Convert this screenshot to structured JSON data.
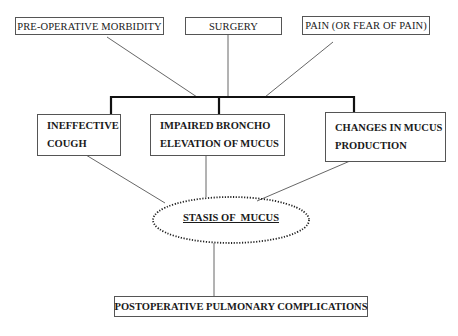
{
  "diagram": {
    "causes": [
      {
        "id": "pre_op",
        "label": "PRE-OPERATIVE MORBIDITY"
      },
      {
        "id": "surgery",
        "label": "SURGERY"
      },
      {
        "id": "pain",
        "label": "PAIN (OR FEAR OF PAIN)"
      }
    ],
    "mechanisms": [
      {
        "id": "cough",
        "lines": [
          "INEFFECTIVE",
          "COUGH"
        ]
      },
      {
        "id": "broncho",
        "lines": [
          "IMPAIRED BRONCHO",
          "ELEVATION OF MUCUS"
        ]
      },
      {
        "id": "mucus_prod",
        "lines": [
          "CHANGES IN MUCUS",
          "PRODUCTION"
        ]
      }
    ],
    "central_node": {
      "label": "STASIS OF  MUCUS",
      "shape": "dotted-ellipse"
    },
    "outcome": {
      "label": "POSTOPERATIVE PULMONARY COMPLICATIONS"
    },
    "edges": [
      {
        "from": "pre_op",
        "to": "bracket"
      },
      {
        "from": "surgery",
        "to": "bracket"
      },
      {
        "from": "pain",
        "to": "bracket"
      },
      {
        "from": "bracket",
        "to": "cough"
      },
      {
        "from": "bracket",
        "to": "broncho"
      },
      {
        "from": "bracket",
        "to": "mucus_prod"
      },
      {
        "from": "cough",
        "to": "central_node"
      },
      {
        "from": "broncho",
        "to": "central_node"
      },
      {
        "from": "mucus_prod",
        "to": "central_node"
      },
      {
        "from": "central_node",
        "to": "outcome"
      }
    ]
  }
}
